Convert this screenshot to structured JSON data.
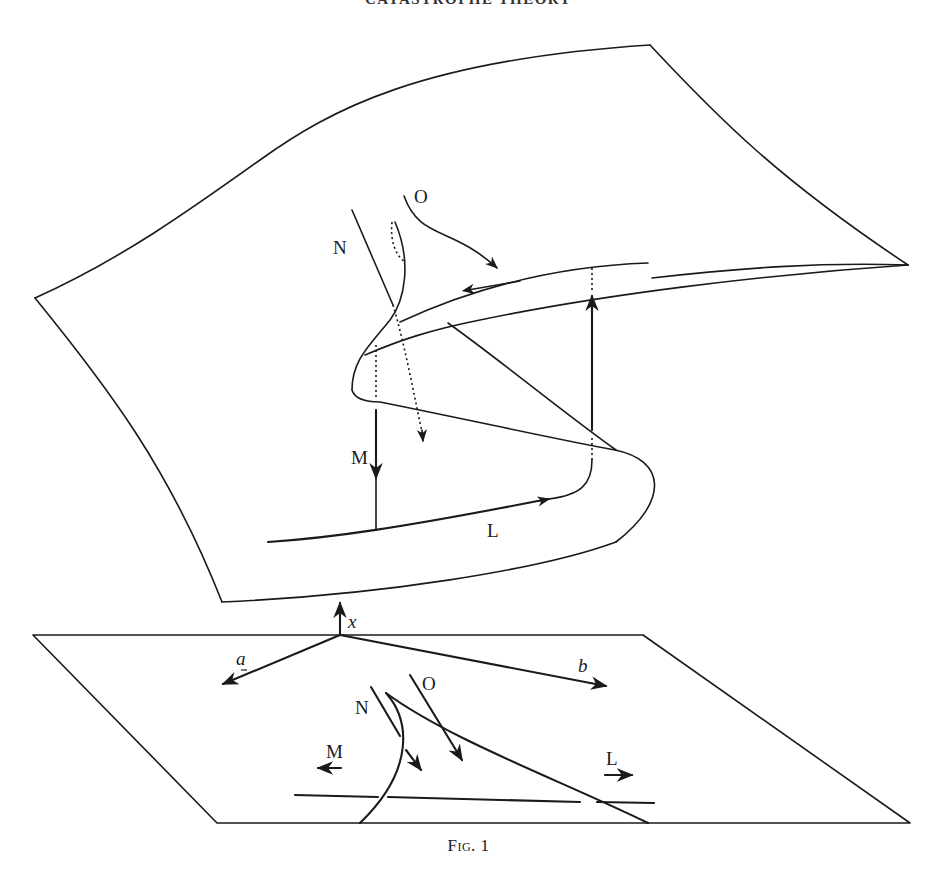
{
  "page": {
    "running_head": "CATASTROPHE THEORY",
    "caption": "Fig. 1"
  },
  "figure": {
    "type": "cusp-catastrophe-surface",
    "behaviour_surface": {
      "labels": {
        "N": "N",
        "O": "O",
        "M": "M",
        "L": "L"
      }
    },
    "control_plane": {
      "axis_labels": {
        "x": "x",
        "a": "a",
        "b": "b"
      },
      "labels": {
        "N": "N",
        "O": "O",
        "M": "M",
        "L": "L"
      }
    }
  }
}
